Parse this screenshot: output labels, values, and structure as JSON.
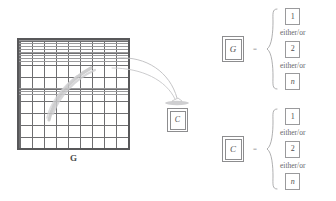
{
  "figure": {
    "grid": {
      "label": "G",
      "accent_color": "#58585a",
      "grid_line_color": "#9a9a9c"
    },
    "middle_box": {
      "label": "C"
    },
    "arrows": {
      "count": 2,
      "color": "#b9b9bb"
    }
  },
  "legend": {
    "rows": [
      {
        "key": "G",
        "equals": "=",
        "options": [
          {
            "value": "1",
            "italic": false
          },
          {
            "value": "2",
            "italic": false
          },
          {
            "value": "n",
            "italic": true
          }
        ],
        "conjunctions": [
          "either/or",
          "either/or"
        ]
      },
      {
        "key": "C",
        "equals": "=",
        "options": [
          {
            "value": "1",
            "italic": false
          },
          {
            "value": "2",
            "italic": false
          },
          {
            "value": "n",
            "italic": true
          }
        ],
        "conjunctions": [
          "either/or",
          "either/or"
        ]
      }
    ]
  }
}
